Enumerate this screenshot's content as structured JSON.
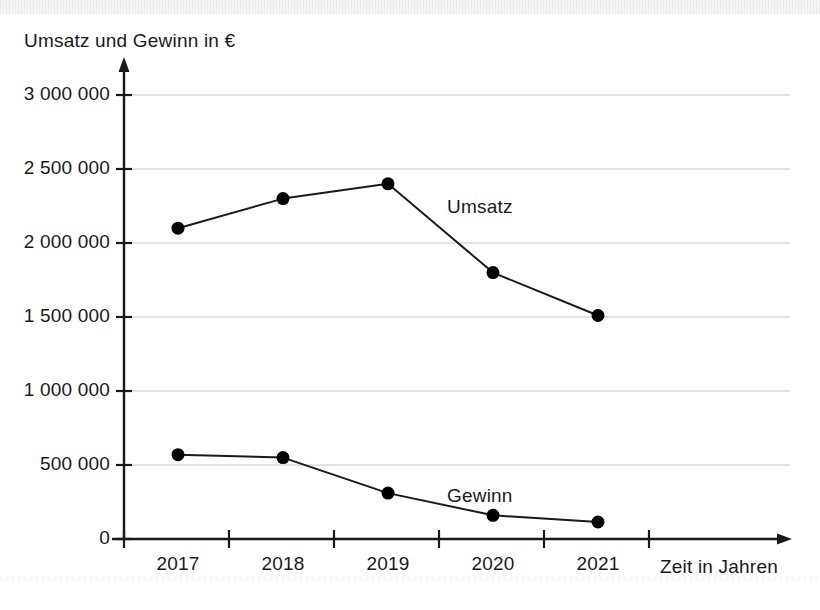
{
  "chart_data": {
    "type": "line",
    "title": "",
    "ylabel": "Umsatz und Gewinn in €",
    "xlabel": "Zeit in Jahren",
    "categories": [
      "2017",
      "2018",
      "2019",
      "2020",
      "2021"
    ],
    "ytick_labels": [
      "0",
      "500 000",
      "1 000 000",
      "1 500 000",
      "2 000 000",
      "2 500 000",
      "3 000 000"
    ],
    "ytick_values": [
      0,
      500000,
      1000000,
      1500000,
      2000000,
      2500000,
      3000000
    ],
    "ylim": [
      0,
      3000000
    ],
    "grid": true,
    "legend_position": "inline",
    "series": [
      {
        "name": "Umsatz",
        "values": [
          2100000,
          2300000,
          2400000,
          1800000,
          1510000
        ]
      },
      {
        "name": "Gewinn",
        "values": [
          570000,
          550000,
          310000,
          160000,
          115000
        ]
      }
    ],
    "colors": {
      "line": "#1a1a1a",
      "marker": "#000000",
      "grid": "#d8d8d8",
      "axis": "#1a1a1a",
      "background": "#ffffff"
    }
  }
}
